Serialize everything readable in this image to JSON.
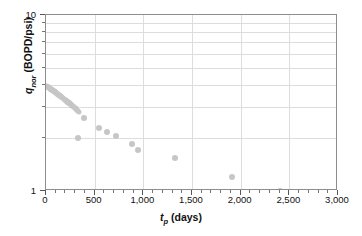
{
  "chart_data": {
    "type": "scatter",
    "title": "",
    "xlabel": "t_p (days)",
    "ylabel": "q_nor (BOPD/psi)",
    "xlabel_parts": {
      "symbol": "t",
      "sub": "p",
      "unit": "(days)"
    },
    "ylabel_parts": {
      "symbol": "q",
      "sub": "nor",
      "unit": "(BOPD/psi)"
    },
    "xlim": [
      0,
      3000
    ],
    "ylim": [
      1,
      10
    ],
    "yscale": "log",
    "xscale": "linear",
    "grid": true,
    "legend": null,
    "marker_color": "#c6c6c6",
    "gridline_color": "#dddddd",
    "axis_color": "#8d8d8d",
    "xticks": [
      0,
      500,
      1000,
      1500,
      2000,
      2500,
      3000
    ],
    "xtick_labels": [
      "0",
      "500",
      "1,000",
      "1,500",
      "2,000",
      "2,500",
      "3,000"
    ],
    "xminor_step": 100,
    "yticks": [
      1,
      10
    ],
    "ytick_labels": [
      "1",
      "10"
    ],
    "yminor_ticks": [
      2,
      3,
      4,
      5,
      6,
      7,
      8,
      9
    ],
    "points": [
      [
        2,
        3.95
      ],
      [
        8,
        3.93
      ],
      [
        14,
        3.91
      ],
      [
        20,
        3.9
      ],
      [
        26,
        3.88
      ],
      [
        32,
        3.86
      ],
      [
        38,
        3.84
      ],
      [
        44,
        3.82
      ],
      [
        50,
        3.8
      ],
      [
        56,
        3.78
      ],
      [
        62,
        3.76
      ],
      [
        68,
        3.74
      ],
      [
        74,
        3.72
      ],
      [
        80,
        3.7
      ],
      [
        86,
        3.68
      ],
      [
        92,
        3.66
      ],
      [
        98,
        3.63
      ],
      [
        104,
        3.61
      ],
      [
        110,
        3.59
      ],
      [
        116,
        3.57
      ],
      [
        122,
        3.55
      ],
      [
        128,
        3.53
      ],
      [
        134,
        3.51
      ],
      [
        140,
        3.49
      ],
      [
        146,
        3.47
      ],
      [
        152,
        3.45
      ],
      [
        158,
        3.43
      ],
      [
        164,
        3.41
      ],
      [
        170,
        3.39
      ],
      [
        176,
        3.37
      ],
      [
        182,
        3.35
      ],
      [
        188,
        3.33
      ],
      [
        194,
        3.31
      ],
      [
        200,
        3.29
      ],
      [
        206,
        3.27
      ],
      [
        212,
        3.25
      ],
      [
        218,
        3.23
      ],
      [
        224,
        3.21
      ],
      [
        230,
        3.19
      ],
      [
        236,
        3.17
      ],
      [
        242,
        3.15
      ],
      [
        248,
        3.13
      ],
      [
        254,
        3.11
      ],
      [
        260,
        3.09
      ],
      [
        266,
        3.07
      ],
      [
        272,
        3.05
      ],
      [
        278,
        3.03
      ],
      [
        284,
        3.01
      ],
      [
        290,
        2.99
      ],
      [
        296,
        2.97
      ],
      [
        302,
        2.95
      ],
      [
        308,
        2.92
      ],
      [
        314,
        2.9
      ],
      [
        320,
        2.88
      ],
      [
        326,
        2.86
      ],
      [
        332,
        2.84
      ],
      [
        338,
        2.82
      ],
      [
        330,
        2.0
      ],
      [
        392,
        2.6
      ],
      [
        545,
        2.27
      ],
      [
        625,
        2.17
      ],
      [
        720,
        2.06
      ],
      [
        880,
        1.84
      ],
      [
        950,
        1.72
      ],
      [
        1325,
        1.53
      ],
      [
        1910,
        1.2
      ],
      [
        2405,
        1.0
      ]
    ]
  }
}
